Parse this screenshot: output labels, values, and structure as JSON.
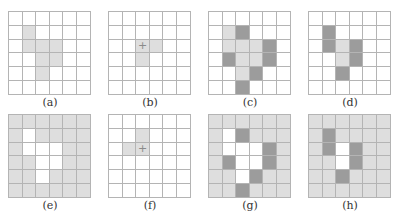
{
  "figure": {
    "grid_size": 6,
    "legend": {
      "w": "white / empty",
      "l": "light gray",
      "d": "dark gray"
    },
    "colors": {
      "white": "#ffffff",
      "light": "#dedede",
      "dark": "#9c9c9c",
      "grid_line": "#b4b4b4"
    },
    "panels": [
      {
        "id": "a",
        "label": "(a)",
        "x": 0,
        "y": 0,
        "cells": [
          "wwwwww",
          "wlwwww",
          "wlllww",
          "wwllww",
          "wwlwww",
          "wwwwww"
        ],
        "marker": null
      },
      {
        "id": "b",
        "label": "(b)",
        "x": 100,
        "y": 0,
        "cells": [
          "wwwwww",
          "wwwwww",
          "wwllww",
          "wwlwww",
          "wwwwww",
          "wwwwww"
        ],
        "marker": [
          2,
          2
        ]
      },
      {
        "id": "c",
        "label": "(c)",
        "x": 200,
        "y": 0,
        "cells": [
          "wwwwww",
          "wldwww",
          "wllldw",
          "wdlldw",
          "wwldww",
          "wwdwww"
        ],
        "marker": null
      },
      {
        "id": "d",
        "label": "(d)",
        "x": 300,
        "y": 0,
        "cells": [
          "wwwwww",
          "wdwwww",
          "wdldww",
          "wwldww",
          "wwdwww",
          "wwwwww"
        ],
        "marker": null
      },
      {
        "id": "e",
        "label": "(e)",
        "x": 0,
        "y": 102,
        "cells": [
          "llllll",
          "lwllll",
          "lwwwll",
          "llwwll",
          "llwlll",
          "llllll"
        ],
        "marker": null
      },
      {
        "id": "f",
        "label": "(f)",
        "x": 100,
        "y": 102,
        "cells": [
          "wwwwww",
          "wwlwww",
          "wllwww",
          "wwwwww",
          "wwwwww",
          "wwwwww"
        ],
        "marker": [
          2,
          2
        ]
      },
      {
        "id": "g",
        "label": "(g)",
        "x": 200,
        "y": 102,
        "cells": [
          "llllll",
          "lwdlll",
          "lwwwdl",
          "ldwwdl",
          "llwdll",
          "lldlll"
        ],
        "marker": null
      },
      {
        "id": "h",
        "label": "(h)",
        "x": 300,
        "y": 102,
        "cells": [
          "llllll",
          "ldllll",
          "ldwdll",
          "llwdll",
          "lldlll",
          "llllll"
        ],
        "marker": null
      }
    ]
  }
}
